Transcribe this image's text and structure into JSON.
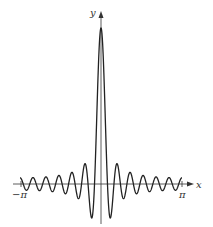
{
  "chart_data": {
    "type": "line",
    "title": "",
    "function": "Dirichlet kernel D_N(x) = sin((N+1/2)x) / sin(x/2)",
    "N": 12,
    "xlabel": "x",
    "ylabel": "y",
    "x_tick_labels": [
      "−π",
      "π"
    ],
    "x_ticks": [
      -3.14159,
      3.14159
    ],
    "xlim": [
      -3.14159,
      3.14159
    ],
    "ylim": [
      -5.5,
      25
    ],
    "peak": {
      "x": 0,
      "y": 25
    },
    "grid": false,
    "legend": null,
    "line_color": "#222222"
  },
  "axes": {
    "x_label": "x",
    "y_label": "y",
    "neg_pi_label": "−π",
    "pi_label": "π"
  }
}
